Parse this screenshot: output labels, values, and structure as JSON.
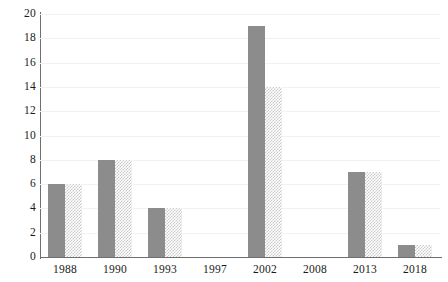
{
  "chart_data": {
    "type": "bar",
    "title": "",
    "subtitle": "",
    "xlabel": "",
    "ylabel": "",
    "categories": [
      "1988",
      "1990",
      "1993",
      "1997",
      "2002",
      "2008",
      "2013",
      "2018"
    ],
    "series": [
      {
        "name": "series-1",
        "style": "solid-gray",
        "color": "#8c8c8c",
        "values": [
          6,
          8,
          4,
          0,
          19,
          0,
          7,
          1
        ]
      },
      {
        "name": "series-2",
        "style": "checkered-light-gray",
        "color": "#c9c9c9",
        "values": [
          6,
          8,
          4,
          0,
          14,
          0,
          7,
          1
        ]
      }
    ],
    "ylim": [
      0,
      20
    ],
    "y_ticks": [
      0,
      2,
      4,
      6,
      8,
      10,
      12,
      14,
      16,
      18,
      20
    ],
    "y_tick_labels": [
      "0",
      "2",
      "4",
      "6",
      "8",
      "10",
      "12",
      "14",
      "16",
      "18",
      "20"
    ],
    "grid": true,
    "grid_axis": "y",
    "legend": false,
    "legend_position": "none",
    "background_color": "#ffffff",
    "axis_color": "#6f6f6f",
    "gridline_color": "#f2f2f2",
    "text_color": "#1a1a1a"
  }
}
